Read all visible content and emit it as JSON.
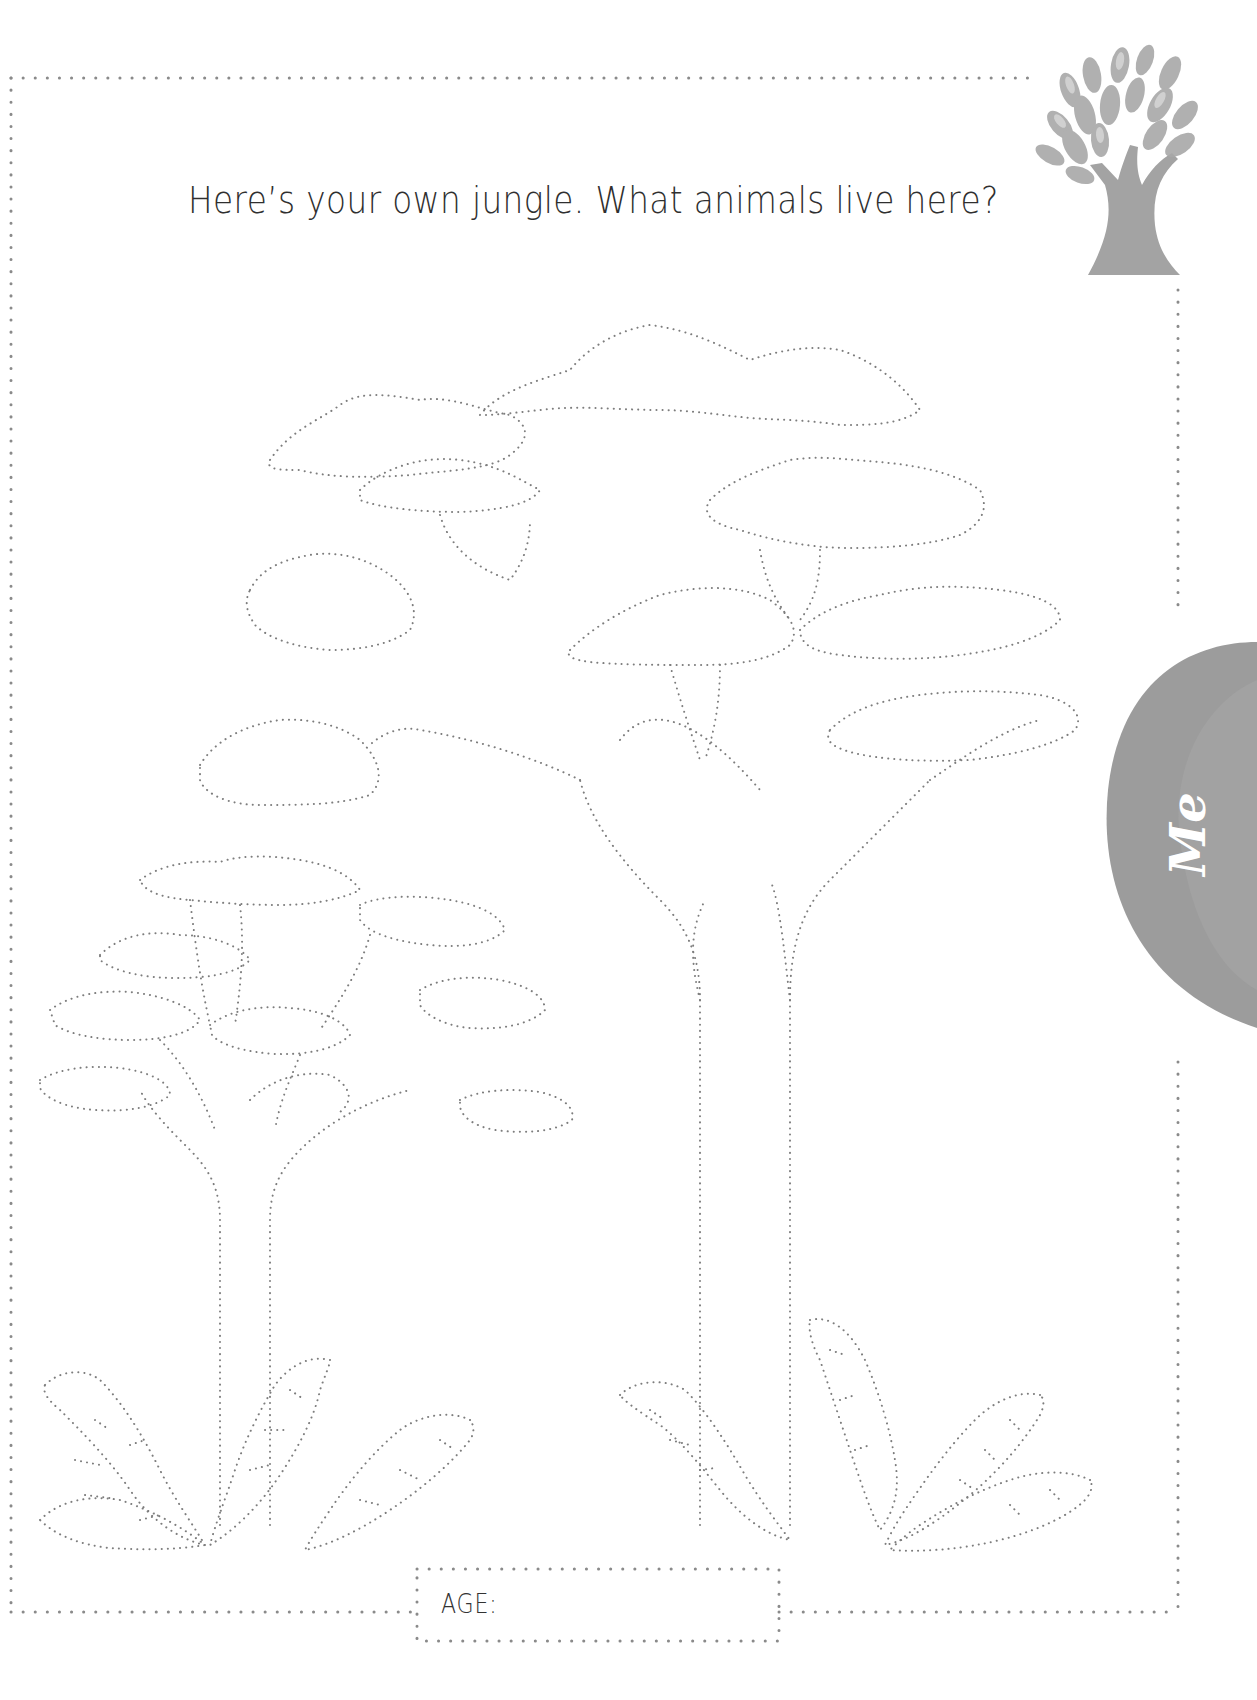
{
  "page": {
    "prompt": "Here’s your own jungle. What animals live here?",
    "age_label": "AGE:",
    "age_value": "",
    "side_tab_label": "Me"
  },
  "colors": {
    "dot_color": "#8a8a8a",
    "tab_gray": "#9a9a9a",
    "tree_gray": "#a0a0a0",
    "text": "#2f2f2f"
  },
  "illustrations": {
    "corner_icon": "tree-icon",
    "coloring_drawings": [
      "large-tree-outline",
      "small-tree-outline",
      "fern-plants-outline"
    ]
  }
}
